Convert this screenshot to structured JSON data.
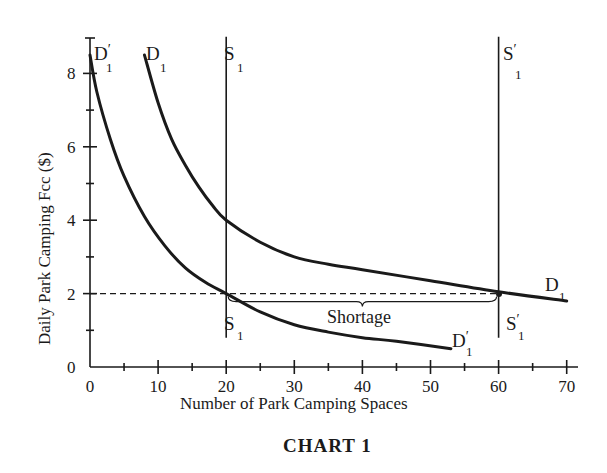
{
  "chart_data": {
    "type": "line",
    "title": "CHART 1",
    "xlabel": "Number of Park Camping Spaces",
    "ylabel": "Daily Park Camping Fcc ($)",
    "xlim": [
      0,
      72
    ],
    "ylim": [
      0,
      9
    ],
    "x_ticks": [
      0,
      10,
      20,
      30,
      40,
      50,
      60,
      70
    ],
    "y_ticks": [
      0,
      2,
      4,
      6,
      8
    ],
    "grid": false,
    "legend": "none (curves labeled inline)",
    "series": [
      {
        "name": "D1",
        "label": "D",
        "subscript": "1",
        "kind": "demand",
        "points": [
          [
            8,
            8.5
          ],
          [
            10,
            7.2
          ],
          [
            12,
            6.2
          ],
          [
            14,
            5.5
          ],
          [
            16,
            4.9
          ],
          [
            18,
            4.4
          ],
          [
            20,
            4.0
          ],
          [
            25,
            3.4
          ],
          [
            30,
            3.0
          ],
          [
            35,
            2.8
          ],
          [
            40,
            2.65
          ],
          [
            50,
            2.35
          ],
          [
            60,
            2.05
          ],
          [
            70,
            1.8
          ]
        ]
      },
      {
        "name": "D1'",
        "label": "D",
        "subscript": "1",
        "prime": true,
        "kind": "demand",
        "points": [
          [
            0,
            8.5
          ],
          [
            1,
            7.5
          ],
          [
            3,
            6.2
          ],
          [
            5,
            5.2
          ],
          [
            8,
            4.1
          ],
          [
            11,
            3.3
          ],
          [
            14,
            2.7
          ],
          [
            17,
            2.3
          ],
          [
            20,
            2.0
          ],
          [
            25,
            1.5
          ],
          [
            30,
            1.15
          ],
          [
            35,
            0.95
          ],
          [
            40,
            0.8
          ],
          [
            45,
            0.7
          ],
          [
            53,
            0.5
          ]
        ]
      },
      {
        "name": "S1",
        "label": "S",
        "subscript": "1",
        "kind": "supply",
        "x": 20,
        "y_range": [
          0.8,
          9
        ]
      },
      {
        "name": "S1'",
        "label": "S",
        "subscript": "1",
        "prime": true,
        "kind": "supply",
        "x": 60,
        "y_range": [
          0.8,
          9
        ]
      }
    ],
    "reference_lines": [
      {
        "kind": "horizontal-dashed",
        "y": 2,
        "x_range": [
          0,
          60
        ]
      }
    ],
    "annotations": [
      {
        "text": "Shortage",
        "type": "brace",
        "x_range": [
          20,
          60
        ],
        "y": 2
      }
    ]
  },
  "labels": {
    "y_axis_title": "Daily Park Camping Fcc ($)",
    "x_axis_title": "Number of Park Camping Spaces",
    "caption": "CHART 1",
    "shortage": "Shortage",
    "x_ticks": [
      "0",
      "10",
      "20",
      "30",
      "40",
      "50",
      "60",
      "70"
    ],
    "y_ticks": [
      "0",
      "2",
      "4",
      "6",
      "8"
    ],
    "d_main": "D",
    "s_main": "S",
    "sub_one": "1",
    "prime": "′"
  }
}
